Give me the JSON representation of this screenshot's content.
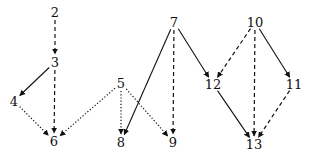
{
  "diagram": {
    "type": "directed-graph",
    "nodes": [
      {
        "id": "2",
        "label": "2",
        "x": 55,
        "y": 12
      },
      {
        "id": "3",
        "label": "3",
        "x": 55,
        "y": 62
      },
      {
        "id": "4",
        "label": "4",
        "x": 14,
        "y": 101
      },
      {
        "id": "6",
        "label": "6",
        "x": 54,
        "y": 141
      },
      {
        "id": "5",
        "label": "5",
        "x": 121,
        "y": 83
      },
      {
        "id": "8",
        "label": "8",
        "x": 121,
        "y": 142
      },
      {
        "id": "9",
        "label": "9",
        "x": 173,
        "y": 142
      },
      {
        "id": "7",
        "label": "7",
        "x": 174,
        "y": 22
      },
      {
        "id": "12",
        "label": "12",
        "x": 213,
        "y": 84
      },
      {
        "id": "10",
        "label": "10",
        "x": 255,
        "y": 22
      },
      {
        "id": "11",
        "label": "11",
        "x": 294,
        "y": 84
      },
      {
        "id": "13",
        "label": "13",
        "x": 254,
        "y": 144
      }
    ],
    "edges": [
      {
        "from": "2",
        "to": "3",
        "style": "dashed"
      },
      {
        "from": "3",
        "to": "6",
        "style": "dashed"
      },
      {
        "from": "3",
        "to": "4",
        "style": "solid"
      },
      {
        "from": "4",
        "to": "6",
        "style": "dotted"
      },
      {
        "from": "5",
        "to": "6",
        "style": "dotted"
      },
      {
        "from": "5",
        "to": "8",
        "style": "dotted"
      },
      {
        "from": "5",
        "to": "9",
        "style": "dotted"
      },
      {
        "from": "7",
        "to": "8",
        "style": "solid"
      },
      {
        "from": "7",
        "to": "9",
        "style": "dashed"
      },
      {
        "from": "7",
        "to": "12",
        "style": "solid"
      },
      {
        "from": "10",
        "to": "12",
        "style": "dashed"
      },
      {
        "from": "10",
        "to": "13",
        "style": "dashed"
      },
      {
        "from": "10",
        "to": "11",
        "style": "solid"
      },
      {
        "from": "12",
        "to": "13",
        "style": "solid"
      },
      {
        "from": "11",
        "to": "13",
        "style": "dashed"
      }
    ],
    "colors": {
      "edge": "#111111",
      "label": "#111111",
      "background": "#ffffff"
    }
  }
}
